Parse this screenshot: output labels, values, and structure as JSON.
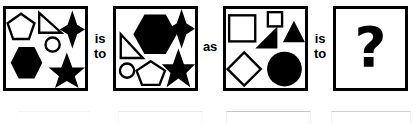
{
  "puzzle": {
    "type": "visual-analogy",
    "relation_labels": {
      "is_to_first": {
        "line1": "is",
        "line2": "to"
      },
      "as": "as",
      "is_to_second": {
        "line1": "is",
        "line2": "to"
      }
    },
    "answer_placeholder": "?",
    "colors": {
      "ink": "#000000",
      "background": "#ffffff",
      "panel_border": "#000000"
    },
    "panels": [
      {
        "id": "panel-a",
        "role": "analogy-term-a",
        "shapes": [
          {
            "name": "pentagon",
            "fill": "outline"
          },
          {
            "name": "right-triangle",
            "fill": "outline"
          },
          {
            "name": "four-pointed-star",
            "fill": "solid"
          },
          {
            "name": "circle",
            "fill": "outline"
          },
          {
            "name": "hexagon",
            "fill": "solid"
          },
          {
            "name": "five-pointed-star",
            "fill": "solid"
          }
        ]
      },
      {
        "id": "panel-b",
        "role": "analogy-term-b",
        "shapes": [
          {
            "name": "hexagon",
            "fill": "solid"
          },
          {
            "name": "four-pointed-star",
            "fill": "solid"
          },
          {
            "name": "five-pointed-star",
            "fill": "solid"
          },
          {
            "name": "right-triangle",
            "fill": "outline"
          },
          {
            "name": "circle",
            "fill": "outline"
          },
          {
            "name": "pentagon",
            "fill": "outline"
          }
        ]
      },
      {
        "id": "panel-c",
        "role": "analogy-term-c",
        "shapes": [
          {
            "name": "square",
            "fill": "outline"
          },
          {
            "name": "small-square",
            "fill": "outline"
          },
          {
            "name": "right-triangle",
            "fill": "solid"
          },
          {
            "name": "triangle",
            "fill": "solid"
          },
          {
            "name": "diamond",
            "fill": "outline"
          },
          {
            "name": "circle",
            "fill": "solid"
          }
        ]
      },
      {
        "id": "panel-d",
        "role": "analogy-answer",
        "shapes": []
      }
    ],
    "ghost_row": {
      "visible": true,
      "description": "faint cropped tops of a second row of answer boxes"
    }
  }
}
